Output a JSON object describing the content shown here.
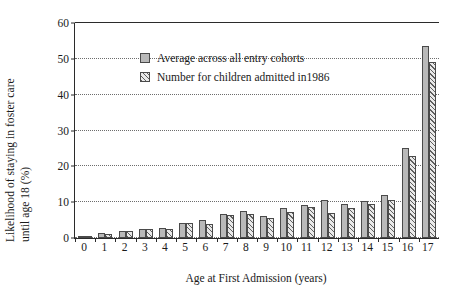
{
  "chart_data": {
    "type": "bar",
    "title": "",
    "xlabel": "Age at First Admission (years)",
    "ylabel_line1": "Likelihood of staying in foster care",
    "ylabel_line2": "until age 18 (%)",
    "ylim": [
      0,
      60
    ],
    "yticks": [
      0,
      10,
      20,
      30,
      40,
      50,
      60
    ],
    "grid": true,
    "legend_position": "inside-upper-left",
    "categories": [
      "0",
      "1",
      "2",
      "3",
      "4",
      "5",
      "6",
      "7",
      "8",
      "9",
      "10",
      "11",
      "12",
      "13",
      "14",
      "15",
      "16",
      "17"
    ],
    "series": [
      {
        "name": "Average across all entry cohorts",
        "pattern": "solid",
        "color": "#b9b9b9",
        "values": [
          0.4,
          1.5,
          2.0,
          2.5,
          2.7,
          4.3,
          5.0,
          6.8,
          7.5,
          6.1,
          8.3,
          9.3,
          10.5,
          9.6,
          10.2,
          12.0,
          25.0,
          53.5
        ]
      },
      {
        "name": "Number for children admitted in1986",
        "pattern": "diagonal-hatch",
        "color": "#e9e9e9",
        "values": [
          0.4,
          1.0,
          1.9,
          2.4,
          2.6,
          4.2,
          4.0,
          6.3,
          6.8,
          5.5,
          7.2,
          8.6,
          7.0,
          8.5,
          9.6,
          10.5,
          23.0,
          49.0
        ]
      }
    ]
  },
  "legend": {
    "items": [
      {
        "label": "Average across all entry cohorts",
        "style": "s1"
      },
      {
        "label": "Number for children admitted in1986",
        "style": "s2"
      }
    ]
  },
  "colors": {
    "series1": "#b9b9b9",
    "series2": "#e9e9e9",
    "axis": "#2b2b2b",
    "grid": "#6d6d6d",
    "background": "#ffffff"
  }
}
